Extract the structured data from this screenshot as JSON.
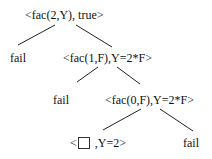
{
  "diagram": {
    "type": "search-tree",
    "nodes": [
      {
        "id": "root",
        "label": "<fac(2,Y), true>",
        "x": 25,
        "y": 8
      },
      {
        "id": "fail1",
        "label": "fail",
        "x": 10,
        "y": 51
      },
      {
        "id": "n1",
        "label": "<fac(1,F),Y=2*F>",
        "x": 63,
        "y": 51
      },
      {
        "id": "fail2",
        "label": "fail",
        "x": 53,
        "y": 93
      },
      {
        "id": "n2",
        "label": "<fac(0,F),Y=2*F>",
        "x": 105,
        "y": 93
      },
      {
        "id": "leaf",
        "label_prefix": "<",
        "label_suffix": " ,Y=2>",
        "has_empty_box": true,
        "x": 70,
        "y": 136
      },
      {
        "id": "fail3",
        "label": "fail",
        "x": 183,
        "y": 136
      }
    ],
    "edges": [
      {
        "from": "root",
        "to": "fail1",
        "x1": 55,
        "y1": 25,
        "x2": 18,
        "y2": 45
      },
      {
        "from": "root",
        "to": "n1",
        "x1": 76,
        "y1": 25,
        "x2": 112,
        "y2": 47
      },
      {
        "from": "n1",
        "to": "fail2",
        "x1": 98,
        "y1": 67,
        "x2": 77,
        "y2": 82
      },
      {
        "from": "n1",
        "to": "n2",
        "x1": 117,
        "y1": 67,
        "x2": 140,
        "y2": 84
      },
      {
        "from": "n2",
        "to": "leaf",
        "x1": 141,
        "y1": 109,
        "x2": 103,
        "y2": 130
      },
      {
        "from": "n2",
        "to": "fail3",
        "x1": 160,
        "y1": 109,
        "x2": 193,
        "y2": 131
      }
    ],
    "colors": {
      "text": "#111111",
      "lines": "#222222",
      "background": "#ffffff"
    }
  }
}
